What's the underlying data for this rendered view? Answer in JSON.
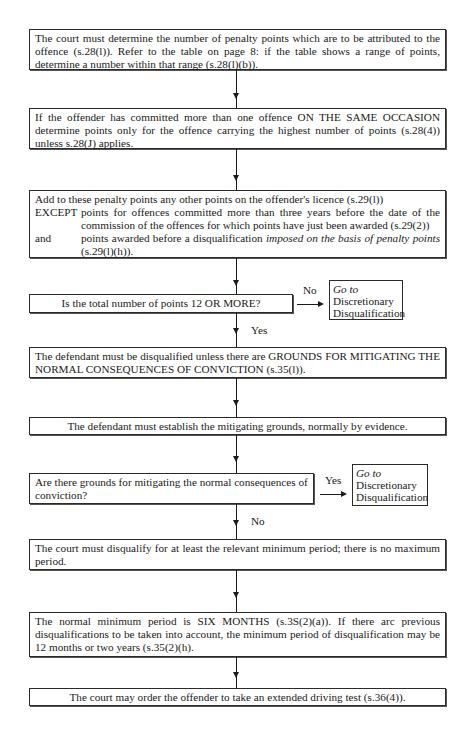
{
  "flowchart": {
    "steps": [
      {
        "text": "The court must determine the number of penalty points which are to be attributed to the offence (s.28(l)). Refer to the table on page 8: if the table shows a range of points, determine a number within that range (s.28(l)(b))."
      },
      {
        "text": "If the offender has committed more than one offence ON THE SAME OCCASION determine points only for the offence carrying the highest number of points (s.28(4)) unless s.28(J) applies."
      },
      {
        "intro": "Add to these penalty points any other points on the offender's licence (s.29(l))",
        "except_label": "EXCEPT",
        "except_text": "points for offences committed more than three years before the date of the commission of the offences for which points have just been awarded (s.29(2))",
        "and_label": "and",
        "and_text_prefix": "points awarded before a disqualification ",
        "and_text_italic": "imposed on the basis of penalty points",
        "and_text_suffix": " (s.29(l)(h))."
      },
      {
        "text": "Is the total number of points 12 OR MORE?"
      },
      {
        "text": "The defendant must be disqualified unless there are GROUNDS FOR MITIGATING THE NORMAL CONSEQUENCES OF CONVICTION (s.35(l))."
      },
      {
        "text": "The defendant must establish the mitigating grounds, normally by evidence."
      },
      {
        "text": "Are there grounds for mitigating the normal consequences of conviction?"
      },
      {
        "text": "The court must disqualify for at least the relevant minimum period; there is no maximum period."
      },
      {
        "text": "The normal minimum period is SIX MONTHS (s.3S(2)(a)). If there arc previous disqualifications to be taken into account, the minimum period of disqualification may be 12 months or two years (s.35(2)(h)."
      },
      {
        "text": "The court may order the offender to take an extended driving test (s.36(4))."
      }
    ],
    "decision1": {
      "no_label": "No",
      "yes_label": "Yes",
      "side_box": {
        "goto": "Go to",
        "line1": "Discretionary",
        "line2": "Disqualification"
      }
    },
    "decision2": {
      "yes_label": "Yes",
      "no_label": "No",
      "side_box": {
        "goto": "Go to",
        "line1": "Discretionary",
        "line2": "Disqualification"
      }
    }
  }
}
